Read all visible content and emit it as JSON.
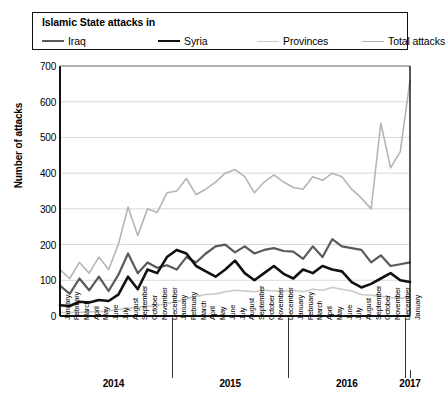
{
  "legend": {
    "title": "Islamic State attacks in",
    "items": [
      {
        "label": "Iraq",
        "color": "#5a5a5a",
        "width": 2.2
      },
      {
        "label": "Syria",
        "color": "#111111",
        "width": 2.6
      },
      {
        "label": "Provinces",
        "color": "#c9c9c9",
        "width": 1.8
      },
      {
        "label": "Total attacks",
        "color": "#b5b5b5",
        "width": 1.8
      }
    ]
  },
  "axes": {
    "ylabel": "Number of attacks",
    "yticks": [
      "0",
      "100",
      "200",
      "300",
      "400",
      "500",
      "600",
      "700"
    ],
    "year_labels": [
      "2014",
      "2015",
      "2016",
      "2017"
    ]
  },
  "chart_data": {
    "type": "line",
    "title": "Islamic State attacks in",
    "xlabel": "",
    "ylabel": "Number of attacks",
    "ylim": [
      0,
      700
    ],
    "ytick_step": 100,
    "grid": true,
    "legend_position": "top",
    "categories": [
      "January",
      "February",
      "March",
      "April",
      "May",
      "June",
      "July",
      "August",
      "September",
      "October",
      "November",
      "December",
      "January",
      "February",
      "March",
      "April",
      "May",
      "June",
      "July",
      "August",
      "September",
      "October",
      "November",
      "December",
      "January",
      "February",
      "March",
      "April",
      "May",
      "June",
      "July",
      "August",
      "September",
      "October",
      "November",
      "December",
      "January"
    ],
    "year_groups": [
      {
        "label": "2014",
        "start": 0,
        "count": 12
      },
      {
        "label": "2015",
        "start": 12,
        "count": 12
      },
      {
        "label": "2016",
        "start": 24,
        "count": 12
      },
      {
        "label": "2017",
        "start": 36,
        "count": 1
      }
    ],
    "series": [
      {
        "name": "Iraq",
        "color": "#5a5a5a",
        "values": [
          85,
          62,
          105,
          72,
          110,
          70,
          115,
          175,
          120,
          150,
          135,
          142,
          130,
          165,
          150,
          175,
          195,
          200,
          178,
          195,
          175,
          185,
          190,
          182,
          180,
          160,
          195,
          165,
          215,
          195,
          190,
          185,
          150,
          170,
          140,
          145,
          150
        ]
      },
      {
        "name": "Syria",
        "color": "#111111",
        "values": [
          30,
          28,
          40,
          38,
          45,
          42,
          60,
          110,
          75,
          130,
          120,
          165,
          185,
          175,
          140,
          125,
          110,
          130,
          155,
          120,
          100,
          120,
          140,
          118,
          105,
          130,
          120,
          140,
          130,
          125,
          95,
          80,
          90,
          105,
          120,
          100,
          95
        ]
      },
      {
        "name": "Provinces",
        "color": "#c9c9c9",
        "values": [
          10,
          10,
          10,
          12,
          12,
          14,
          18,
          22,
          24,
          26,
          30,
          35,
          40,
          48,
          55,
          60,
          62,
          68,
          72,
          70,
          68,
          72,
          70,
          70,
          72,
          68,
          75,
          72,
          80,
          75,
          70,
          60,
          58,
          55,
          52,
          50,
          52
        ]
      },
      {
        "name": "Total attacks",
        "color": "#b5b5b5",
        "values": [
          130,
          105,
          150,
          120,
          165,
          130,
          200,
          305,
          225,
          300,
          290,
          345,
          350,
          385,
          340,
          355,
          375,
          400,
          410,
          390,
          345,
          375,
          395,
          375,
          360,
          355,
          390,
          380,
          400,
          390,
          355,
          330,
          300,
          540,
          415,
          460,
          660
        ]
      }
    ]
  }
}
